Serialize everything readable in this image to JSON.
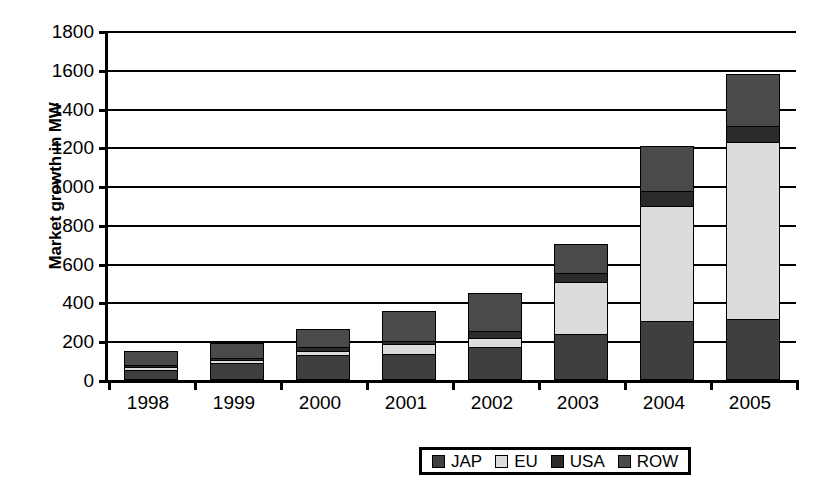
{
  "chart_data": {
    "type": "bar",
    "subtype": "stacked-bar",
    "title": "",
    "xlabel": "",
    "ylabel": "Market growth in MW",
    "ylim": [
      0,
      1800
    ],
    "ytick_step": 200,
    "yticks": [
      0,
      200,
      400,
      600,
      800,
      1000,
      1200,
      1400,
      1600,
      1800
    ],
    "grid": true,
    "legend_position": "bottom-right",
    "categories": [
      "1998",
      "1999",
      "2000",
      "2001",
      "2002",
      "2003",
      "2004",
      "2005"
    ],
    "series": [
      {
        "name": "JAP",
        "color": "#3f3f3f",
        "values": [
          45,
          85,
          125,
          130,
          165,
          230,
          300,
          310
        ]
      },
      {
        "name": "EU",
        "color": "#dcdcdc",
        "values": [
          60,
          100,
          145,
          180,
          210,
          500,
          890,
          1220
        ]
      },
      {
        "name": "USA",
        "color": "#2b2b2b",
        "values": [
          10,
          10,
          20,
          15,
          40,
          45,
          80,
          85
        ]
      },
      {
        "name": "ROW",
        "color": "#4a4a4a",
        "values": [
          25,
          70,
          90,
          155,
          190,
          150,
          230,
          270
        ]
      }
    ],
    "series_stacked_values": {
      "JAP": [
        45,
        85,
        125,
        130,
        165,
        230,
        300,
        310
      ],
      "EU": [
        15,
        15,
        20,
        50,
        45,
        270,
        590,
        910
      ],
      "USA": [
        10,
        10,
        20,
        15,
        40,
        45,
        80,
        85
      ],
      "ROW": [
        70,
        75,
        90,
        155,
        190,
        150,
        230,
        270
      ]
    },
    "cumulative_tops": {
      "1998": {
        "JAP": 45,
        "EU": 60,
        "USA": 70,
        "ROW": 140
      },
      "1999": {
        "JAP": 85,
        "EU": 100,
        "USA": 110,
        "ROW": 185
      },
      "2000": {
        "JAP": 125,
        "EU": 145,
        "USA": 165,
        "ROW": 255
      },
      "2001": {
        "JAP": 130,
        "EU": 180,
        "USA": 195,
        "ROW": 350
      },
      "2002": {
        "JAP": 165,
        "EU": 210,
        "USA": 250,
        "ROW": 440
      },
      "2003": {
        "JAP": 230,
        "EU": 500,
        "USA": 545,
        "ROW": 695
      },
      "2004": {
        "JAP": 300,
        "EU": 890,
        "USA": 970,
        "ROW": 1200
      },
      "2005": {
        "JAP": 310,
        "EU": 1220,
        "USA": 1305,
        "ROW": 1570
      }
    },
    "totals": [
      140,
      185,
      255,
      350,
      440,
      695,
      1200,
      1570
    ]
  },
  "axis": {
    "y_title": "Market growth in MW",
    "y_labels": [
      "1800",
      "1600",
      "1400",
      "1200",
      "1000",
      "800",
      "600",
      "400",
      "200",
      "0"
    ],
    "x_labels": [
      "1998",
      "1999",
      "2000",
      "2001",
      "2002",
      "2003",
      "2004",
      "2005"
    ]
  },
  "legend": {
    "items": [
      {
        "label": "JAP",
        "color": "#3f3f3f"
      },
      {
        "label": "EU",
        "color": "#dcdcdc"
      },
      {
        "label": "USA",
        "color": "#2b2b2b"
      },
      {
        "label": "ROW",
        "color": "#4a4a4a"
      }
    ]
  }
}
